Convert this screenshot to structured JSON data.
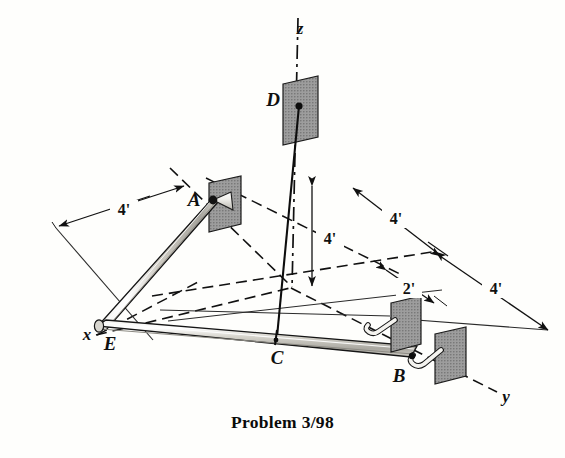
{
  "figure": {
    "caption": "Problem 3/98",
    "axes": [
      {
        "name": "x-axis",
        "label": "x"
      },
      {
        "name": "y-axis",
        "label": "y"
      },
      {
        "name": "z-axis",
        "label": "z"
      }
    ],
    "points": [
      {
        "id": "A",
        "label": "A",
        "support": "ball-and-socket on plate"
      },
      {
        "id": "B",
        "label": "B",
        "support": "bearing on plate"
      },
      {
        "id": "C",
        "label": "C",
        "support": "cable attachment on bar"
      },
      {
        "id": "D",
        "label": "D",
        "support": "anchor on plate at z-axis"
      },
      {
        "id": "E",
        "label": "E",
        "support": "bend joint of bars"
      }
    ],
    "dimensions": [
      {
        "id": "dim-x-4",
        "label": "4'",
        "axis": "x",
        "value": 4,
        "unit": "ft"
      },
      {
        "id": "dim-z-4",
        "label": "4'",
        "axis": "z",
        "value": 4,
        "unit": "ft"
      },
      {
        "id": "dim-y-upper-4",
        "label": "4'",
        "axis": "y",
        "value": 4,
        "unit": "ft"
      },
      {
        "id": "dim-y-lower-4",
        "label": "4'",
        "axis": "y",
        "value": 4,
        "unit": "ft"
      },
      {
        "id": "dim-2",
        "label": "2'",
        "axis": "y",
        "value": 2,
        "unit": "ft"
      }
    ],
    "colors": {
      "plate_fill": "#9d9d9d",
      "plate_edge": "#1a1a1a",
      "bar_fill": "#c9c7bf",
      "line": "#111111",
      "paper": "#fefefc"
    }
  }
}
